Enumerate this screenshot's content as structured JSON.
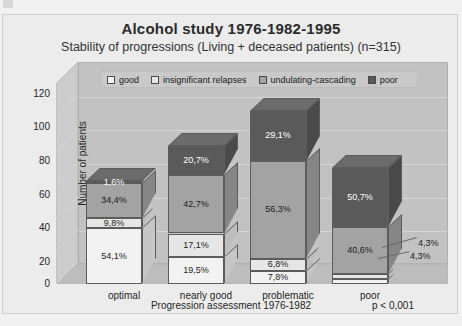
{
  "title": "Alcohol study 1976-1982-1995",
  "subtitle": "Stability of progressions (Living + deceased patients) (n=315)",
  "pvalue": "p < 0,001",
  "axes": {
    "ylabel": "Number of patients",
    "xlabel": "Progression assessment 1976-1982",
    "yticks": [
      "120",
      "100",
      "80",
      "60",
      "40",
      "20",
      "0"
    ]
  },
  "legend": [
    {
      "label": "good",
      "color": "#f2f2f2",
      "name": "legend-swatch-good"
    },
    {
      "label": "insignificant relapses",
      "color": "#e6e6e6",
      "name": "legend-swatch-insignificant-relapses"
    },
    {
      "label": "undulating-cascading",
      "color": "#a3a3a3",
      "name": "legend-swatch-undulating-cascading"
    },
    {
      "label": "poor",
      "color": "#5a5a5a",
      "name": "legend-swatch-poor"
    }
  ],
  "callouts": [
    {
      "text": "4,3%"
    },
    {
      "text": "4,3%"
    }
  ],
  "chart_data": {
    "type": "bar",
    "subtype": "stacked-3d-column",
    "title": "Alcohol study 1976-1982-1995",
    "subtitle": "Stability of progressions (Living + deceased patients) (n=315)",
    "xlabel": "Progression assessment 1976-1982",
    "ylabel": "Number of patients",
    "ylim": [
      0,
      120
    ],
    "ytick_step": 20,
    "grid": true,
    "legend_position": "top-inside",
    "annotation": "p < 0,001",
    "n_total": 315,
    "categories": [
      "optimal",
      "nearly good",
      "problematic",
      "poor"
    ],
    "category_totals": [
      61,
      82,
      103,
      69
    ],
    "series": [
      {
        "name": "good",
        "color": "#f2f2f2",
        "values": [
          33,
          16,
          8,
          3
        ],
        "labels": [
          "54,1%",
          "19,5%",
          "7,8%",
          "4,3%"
        ]
      },
      {
        "name": "insignificant relapses",
        "color": "#e6e6e6",
        "values": [
          6,
          14,
          7,
          3
        ],
        "labels": [
          "9,8%",
          "17,1%",
          "6,8%",
          "4,3%"
        ]
      },
      {
        "name": "undulating-cascading",
        "color": "#a3a3a3",
        "values": [
          21,
          35,
          58,
          28
        ],
        "labels": [
          "34,4%",
          "42,7%",
          "56,3%",
          "40,6%"
        ]
      },
      {
        "name": "poor",
        "color": "#5a5a5a",
        "values": [
          1,
          17,
          30,
          35
        ],
        "labels": [
          "1,6%",
          "20,7%",
          "29,1%",
          "50,7%"
        ]
      }
    ]
  }
}
